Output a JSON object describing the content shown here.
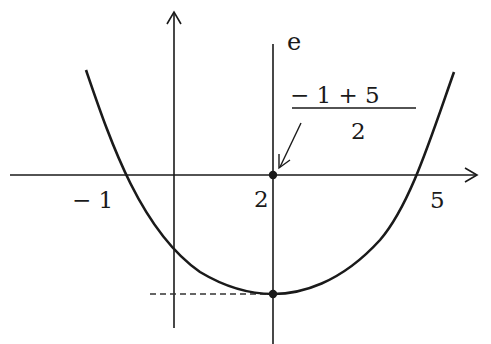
{
  "diagram": {
    "type": "parabola-symmetry-sketch",
    "axis_label_vertical_line": "e",
    "x_tick_labels": {
      "left_root": "− 1",
      "vertex_x": "2",
      "right_root": "5"
    },
    "formula": {
      "numerator": "− 1 + 5",
      "denominator": "2"
    },
    "elements": [
      "x-axis with arrow",
      "y-axis with arrow",
      "vertical line e through x = 2",
      "upward parabola with roots at -1 and 5",
      "vertex point on line e",
      "point (2, 0) on x-axis",
      "arrow from formula to point (2, 0)",
      "dashed line from vertex to y-axis"
    ],
    "colors": {
      "ink": "#1a1a1a",
      "background": "#ffffff"
    }
  }
}
